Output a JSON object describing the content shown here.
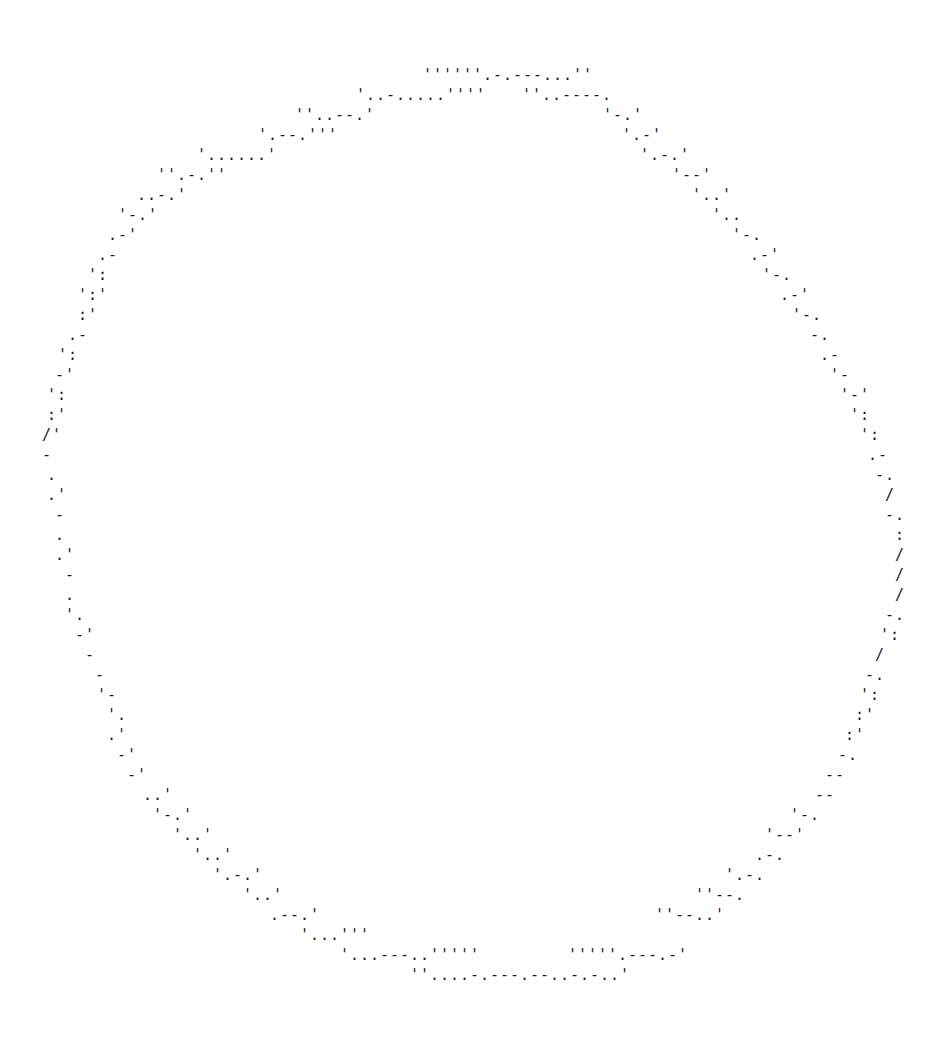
{
  "ascii_art": {
    "description": "ASCII-art circle outline",
    "color": "#1a1a1a",
    "background": "#ffffff",
    "fragments": [
      {
        "x": 423,
        "y": 66,
        "text": "''''''.-.---...''"
      },
      {
        "x": 356,
        "y": 86,
        "text": "'..-.....''''"
      },
      {
        "x": 522,
        "y": 86,
        "text": "''..----."
      },
      {
        "x": 295,
        "y": 106,
        "text": "''..--.'"
      },
      {
        "x": 603,
        "y": 106,
        "text": "'-.'"
      },
      {
        "x": 258,
        "y": 126,
        "text": "'.--.'''"
      },
      {
        "x": 622,
        "y": 126,
        "text": "'.-'"
      },
      {
        "x": 197,
        "y": 146,
        "text": "'......'"
      },
      {
        "x": 640,
        "y": 146,
        "text": "'.-.'"
      },
      {
        "x": 157,
        "y": 166,
        "text": "''.-.''"
      },
      {
        "x": 672,
        "y": 166,
        "text": "'--'"
      },
      {
        "x": 137,
        "y": 186,
        "text": "..-.'"
      },
      {
        "x": 692,
        "y": 186,
        "text": "'..'"
      },
      {
        "x": 118,
        "y": 206,
        "text": "'-.'"
      },
      {
        "x": 712,
        "y": 206,
        "text": "'.."
      },
      {
        "x": 108,
        "y": 226,
        "text": ".-'"
      },
      {
        "x": 732,
        "y": 226,
        "text": "'-."
      },
      {
        "x": 98,
        "y": 246,
        "text": ".-"
      },
      {
        "x": 750,
        "y": 246,
        "text": ".-'"
      },
      {
        "x": 88,
        "y": 266,
        "text": "':"
      },
      {
        "x": 762,
        "y": 266,
        "text": "'-."
      },
      {
        "x": 78,
        "y": 286,
        "text": "':'"
      },
      {
        "x": 780,
        "y": 286,
        "text": ".-'"
      },
      {
        "x": 78,
        "y": 306,
        "text": ":'"
      },
      {
        "x": 792,
        "y": 306,
        "text": "'-."
      },
      {
        "x": 68,
        "y": 326,
        "text": ".-"
      },
      {
        "x": 810,
        "y": 326,
        "text": "-."
      },
      {
        "x": 58,
        "y": 346,
        "text": "':"
      },
      {
        "x": 820,
        "y": 346,
        "text": ".-"
      },
      {
        "x": 55,
        "y": 366,
        "text": "-'"
      },
      {
        "x": 830,
        "y": 366,
        "text": "'-"
      },
      {
        "x": 47,
        "y": 386,
        "text": "':"
      },
      {
        "x": 840,
        "y": 386,
        "text": "'-'"
      },
      {
        "x": 47,
        "y": 406,
        "text": ":'"
      },
      {
        "x": 850,
        "y": 406,
        "text": "':"
      },
      {
        "x": 42,
        "y": 426,
        "text": "/'"
      },
      {
        "x": 860,
        "y": 426,
        "text": "':"
      },
      {
        "x": 42,
        "y": 446,
        "text": "-"
      },
      {
        "x": 868,
        "y": 446,
        "text": ".-"
      },
      {
        "x": 47,
        "y": 466,
        "text": "."
      },
      {
        "x": 875,
        "y": 466,
        "text": "-."
      },
      {
        "x": 47,
        "y": 486,
        "text": ".'"
      },
      {
        "x": 885,
        "y": 486,
        "text": "/"
      },
      {
        "x": 55,
        "y": 506,
        "text": "-"
      },
      {
        "x": 885,
        "y": 506,
        "text": "-."
      },
      {
        "x": 55,
        "y": 526,
        "text": "."
      },
      {
        "x": 895,
        "y": 526,
        "text": ":"
      },
      {
        "x": 55,
        "y": 546,
        "text": ".'"
      },
      {
        "x": 895,
        "y": 546,
        "text": "/"
      },
      {
        "x": 65,
        "y": 566,
        "text": "-"
      },
      {
        "x": 895,
        "y": 566,
        "text": "/"
      },
      {
        "x": 65,
        "y": 586,
        "text": "."
      },
      {
        "x": 895,
        "y": 586,
        "text": "/"
      },
      {
        "x": 65,
        "y": 606,
        "text": "'."
      },
      {
        "x": 885,
        "y": 606,
        "text": "-."
      },
      {
        "x": 75,
        "y": 626,
        "text": "-'"
      },
      {
        "x": 880,
        "y": 626,
        "text": "':"
      },
      {
        "x": 85,
        "y": 646,
        "text": "-"
      },
      {
        "x": 875,
        "y": 646,
        "text": "/"
      },
      {
        "x": 95,
        "y": 666,
        "text": "-"
      },
      {
        "x": 865,
        "y": 666,
        "text": "-."
      },
      {
        "x": 97,
        "y": 686,
        "text": "'-"
      },
      {
        "x": 860,
        "y": 686,
        "text": "':"
      },
      {
        "x": 107,
        "y": 706,
        "text": "'."
      },
      {
        "x": 855,
        "y": 706,
        "text": ":'"
      },
      {
        "x": 107,
        "y": 726,
        "text": ".'"
      },
      {
        "x": 845,
        "y": 726,
        "text": ":'"
      },
      {
        "x": 117,
        "y": 746,
        "text": "-'"
      },
      {
        "x": 838,
        "y": 746,
        "text": "-."
      },
      {
        "x": 127,
        "y": 766,
        "text": "-'"
      },
      {
        "x": 825,
        "y": 766,
        "text": "--"
      },
      {
        "x": 143,
        "y": 786,
        "text": "..'"
      },
      {
        "x": 815,
        "y": 786,
        "text": "--"
      },
      {
        "x": 153,
        "y": 806,
        "text": "'-.'"
      },
      {
        "x": 790,
        "y": 806,
        "text": "'-."
      },
      {
        "x": 173,
        "y": 826,
        "text": "'..'"
      },
      {
        "x": 765,
        "y": 826,
        "text": "'--'"
      },
      {
        "x": 193,
        "y": 846,
        "text": "'..'"
      },
      {
        "x": 755,
        "y": 846,
        "text": ".-."
      },
      {
        "x": 213,
        "y": 866,
        "text": "'.-.'"
      },
      {
        "x": 725,
        "y": 866,
        "text": "'.-."
      },
      {
        "x": 243,
        "y": 886,
        "text": "'..'"
      },
      {
        "x": 695,
        "y": 886,
        "text": "''--."
      },
      {
        "x": 270,
        "y": 906,
        "text": ".--.'"
      },
      {
        "x": 655,
        "y": 906,
        "text": "''--..'"
      },
      {
        "x": 300,
        "y": 926,
        "text": "'...'''"
      },
      {
        "x": 340,
        "y": 946,
        "text": "'...---..'''''"
      },
      {
        "x": 568,
        "y": 946,
        "text": "'''''.---.-'"
      },
      {
        "x": 410,
        "y": 966,
        "text": "''....-.---.--..-.-..'"
      }
    ]
  }
}
